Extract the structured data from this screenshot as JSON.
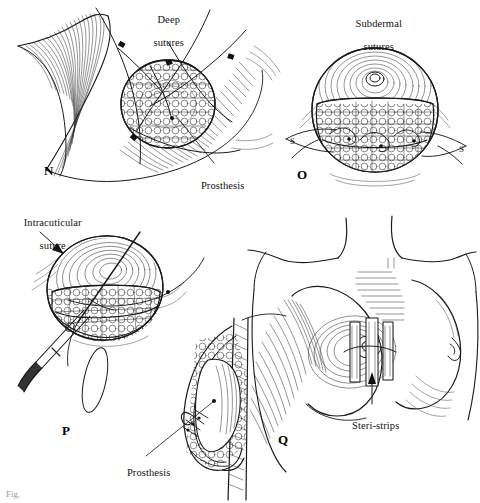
{
  "figure": {
    "kind": "surgical-illustration-plate",
    "background": "#ffffff",
    "ink_color": "#1a1a1a",
    "panel_count": 4
  },
  "panels": [
    {
      "letter": "N",
      "name": "deep-sutures-panel",
      "labels": [
        {
          "text": "Deep\nsutures",
          "name": "deep-sutures-label"
        },
        {
          "text": "Prosthesis",
          "name": "prosthesis-label-n"
        }
      ]
    },
    {
      "letter": "O",
      "name": "subdermal-sutures-panel",
      "labels": [
        {
          "text": "Subdermal\nsutures",
          "name": "subdermal-sutures-label"
        }
      ]
    },
    {
      "letter": "P",
      "name": "intracuticular-suture-panel",
      "labels": [
        {
          "text": "Intracuticular\nsuture",
          "name": "intracuticular-suture-label"
        },
        {
          "text": "Prosthesis",
          "name": "prosthesis-label-p"
        }
      ]
    },
    {
      "letter": "Q",
      "name": "steri-strips-panel",
      "labels": [
        {
          "text": "Steri-strips",
          "name": "steri-strips-label"
        }
      ]
    }
  ],
  "labels": {
    "deep_sutures_l1": "Deep",
    "deep_sutures_l2": "sutures",
    "prosthesis_n": "Prosthesis",
    "subdermal_l1": "Subdermal",
    "subdermal_l2": "sutures",
    "intracuticular_l1": "Intracuticular",
    "intracuticular_l2": "suture",
    "prosthesis_p": "Prosthesis",
    "steri_strips": "Steri-strips"
  },
  "panel_letters": {
    "n": "N",
    "o": "O",
    "p": "P",
    "q": "Q"
  },
  "caption": {
    "partial_text": "Fig."
  }
}
